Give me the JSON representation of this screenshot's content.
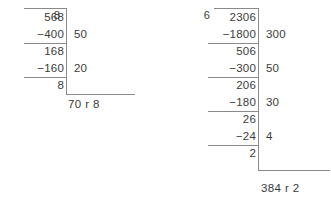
{
  "page": {
    "kind": "long-division-worked-examples",
    "ink_color": "#3b3b3b",
    "rule_color": "#8a8a8a",
    "background": "#ffffff",
    "remainder_separator": "r"
  },
  "problems": [
    {
      "id": "left",
      "divisor": "8",
      "dividend": "568",
      "steps": [
        {
          "subtrahend": "−400",
          "partial_quotient": "50",
          "difference": "168"
        },
        {
          "subtrahend": "−160",
          "partial_quotient": "20",
          "difference": "8"
        }
      ],
      "remainder": "8",
      "quotient": "70",
      "answer": "70 r 8"
    },
    {
      "id": "right",
      "divisor": "6",
      "dividend": "2306",
      "steps": [
        {
          "subtrahend": "−1800",
          "partial_quotient": "300",
          "difference": "506"
        },
        {
          "subtrahend": "−300",
          "partial_quotient": "50",
          "difference": "206"
        },
        {
          "subtrahend": "−180",
          "partial_quotient": "30",
          "difference": "26"
        },
        {
          "subtrahend": "−24",
          "partial_quotient": "4",
          "difference": "2"
        }
      ],
      "remainder": "2",
      "quotient": "384",
      "answer": "384 r 2"
    }
  ]
}
